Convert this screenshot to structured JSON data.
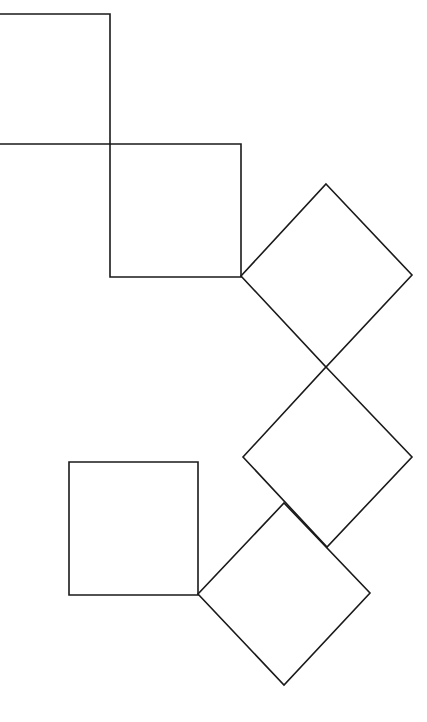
{
  "diagram": {
    "type": "geometric-squares",
    "stroke_color": "#1a1a1a",
    "background": "#ffffff",
    "canvas": {
      "width": 427,
      "height": 722
    },
    "shapes": [
      {
        "id": "square-top-left",
        "kind": "square",
        "points": [
          [
            -2,
            14
          ],
          [
            110,
            14
          ],
          [
            110,
            144
          ],
          [
            -2,
            144
          ]
        ]
      },
      {
        "id": "square-upper-middle",
        "kind": "square",
        "points": [
          [
            110,
            144
          ],
          [
            241,
            144
          ],
          [
            241,
            277
          ],
          [
            110,
            277
          ]
        ]
      },
      {
        "id": "diamond-upper-right",
        "kind": "rotated-square",
        "points": [
          [
            326,
            184
          ],
          [
            412,
            275
          ],
          [
            326,
            367
          ],
          [
            241,
            276
          ]
        ]
      },
      {
        "id": "diamond-middle-right",
        "kind": "rotated-square",
        "points": [
          [
            326,
            367
          ],
          [
            412,
            457
          ],
          [
            327,
            547
          ],
          [
            243,
            457
          ]
        ]
      },
      {
        "id": "square-bottom-left",
        "kind": "square",
        "points": [
          [
            69,
            462
          ],
          [
            198,
            462
          ],
          [
            198,
            595
          ],
          [
            69,
            595
          ]
        ]
      },
      {
        "id": "diamond-bottom",
        "kind": "rotated-square",
        "points": [
          [
            284,
            503
          ],
          [
            370,
            593
          ],
          [
            284,
            685
          ],
          [
            198,
            594
          ]
        ]
      }
    ]
  }
}
